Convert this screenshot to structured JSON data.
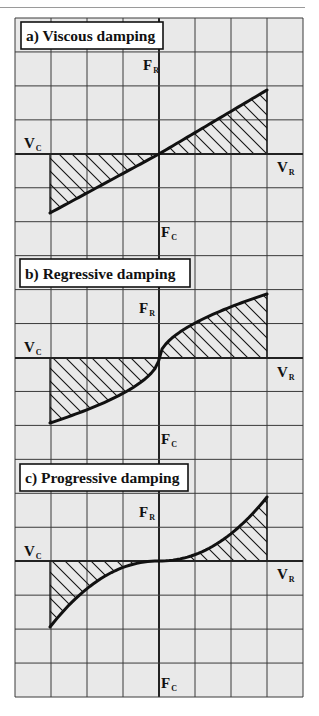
{
  "diagram": {
    "background": "#e9e9e9",
    "grid_color": "#3a3a3a",
    "grid": {
      "x0": 15,
      "y0": 18,
      "cols": 8,
      "rows": 20,
      "col_w": 36,
      "row_h": 33.95
    },
    "vertical_axis_x": 159,
    "panels": [
      {
        "id": "a",
        "title": "a) Viscous damping",
        "title_box": {
          "x": 21,
          "y": 22,
          "w": 142,
          "h": 27
        },
        "curve_type": "linear",
        "axis_y": 154,
        "labels": {
          "force_rebound": {
            "main": "F",
            "sub": "R",
            "x": 143,
            "y": 70
          },
          "force_compression": {
            "main": "F",
            "sub": "C",
            "x": 161,
            "y": 237
          },
          "velocity_compression": {
            "main": "V",
            "sub": "C",
            "x": 24,
            "y": 148
          },
          "velocity_rebound": {
            "main": "V",
            "sub": "R",
            "x": 277,
            "y": 172
          }
        },
        "curve": {
          "x_start": 50,
          "y_start": 213,
          "x_mid": 159,
          "y_mid": 154,
          "x_end": 267,
          "y_end": 90
        }
      },
      {
        "id": "b",
        "title": "b) Regressive damping",
        "title_box": {
          "x": 20,
          "y": 259,
          "w": 170,
          "h": 28
        },
        "curve_type": "regressive",
        "axis_y": 358,
        "labels": {
          "force_rebound": {
            "main": "F",
            "sub": "R",
            "x": 139,
            "y": 313
          },
          "force_compression": {
            "main": "F",
            "sub": "C",
            "x": 161,
            "y": 444
          },
          "velocity_compression": {
            "main": "V",
            "sub": "C",
            "x": 24,
            "y": 352
          },
          "velocity_rebound": {
            "main": "V",
            "sub": "R",
            "x": 277,
            "y": 377
          }
        },
        "curve": {
          "x_start": 50,
          "y_start": 423,
          "x_mid": 159,
          "y_mid": 358,
          "x_end": 267,
          "y_end": 294
        }
      },
      {
        "id": "c",
        "title": "c) Progressive damping",
        "title_box": {
          "x": 20,
          "y": 464,
          "w": 168,
          "h": 27
        },
        "curve_type": "progressive",
        "axis_y": 561,
        "labels": {
          "force_rebound": {
            "main": "F",
            "sub": "R",
            "x": 139,
            "y": 517
          },
          "force_compression": {
            "main": "F",
            "sub": "C",
            "x": 161,
            "y": 688
          },
          "velocity_compression": {
            "main": "V",
            "sub": "C",
            "x": 24,
            "y": 556
          },
          "velocity_rebound": {
            "main": "V",
            "sub": "R",
            "x": 277,
            "y": 579
          }
        },
        "curve": {
          "x_start": 50,
          "y_start": 627,
          "x_mid": 159,
          "y_mid": 561,
          "x_end": 267,
          "y_end": 497
        }
      }
    ],
    "hatch_spacing": 13
  }
}
